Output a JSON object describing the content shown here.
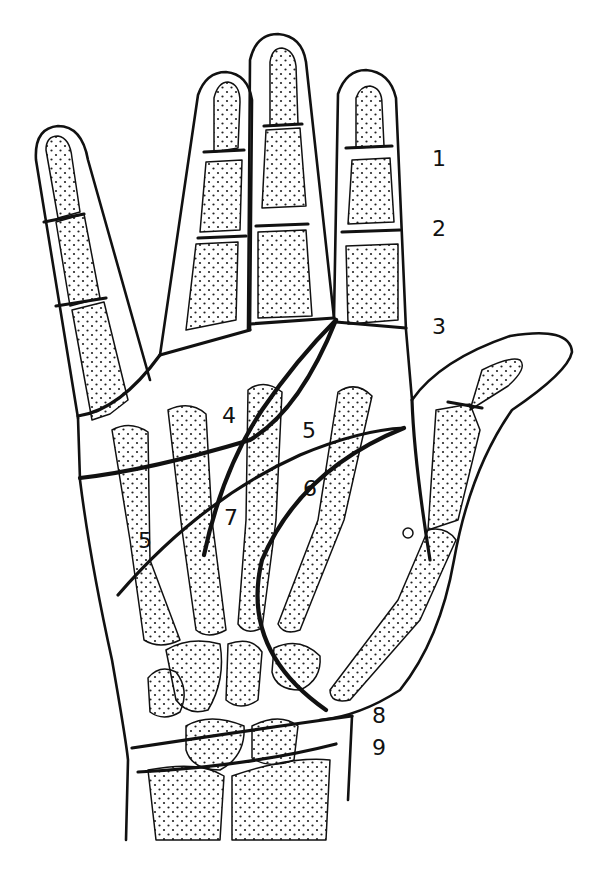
{
  "figure": {
    "colors": {
      "line": "#111111",
      "background": "#ffffff",
      "stipple": "#222222"
    },
    "labels": [
      {
        "id": "1",
        "text": "1",
        "x": 432,
        "y": 148
      },
      {
        "id": "2",
        "text": "2",
        "x": 432,
        "y": 218
      },
      {
        "id": "3",
        "text": "3",
        "x": 432,
        "y": 316
      },
      {
        "id": "4",
        "text": "4",
        "x": 222,
        "y": 405
      },
      {
        "id": "5a",
        "text": "5",
        "x": 302,
        "y": 420
      },
      {
        "id": "6",
        "text": "6",
        "x": 303,
        "y": 478
      },
      {
        "id": "7",
        "text": "7",
        "x": 224,
        "y": 507
      },
      {
        "id": "5b",
        "text": "5",
        "x": 138,
        "y": 530
      },
      {
        "id": "8",
        "text": "8",
        "x": 372,
        "y": 705
      },
      {
        "id": "9",
        "text": "9",
        "x": 372,
        "y": 737
      }
    ]
  }
}
